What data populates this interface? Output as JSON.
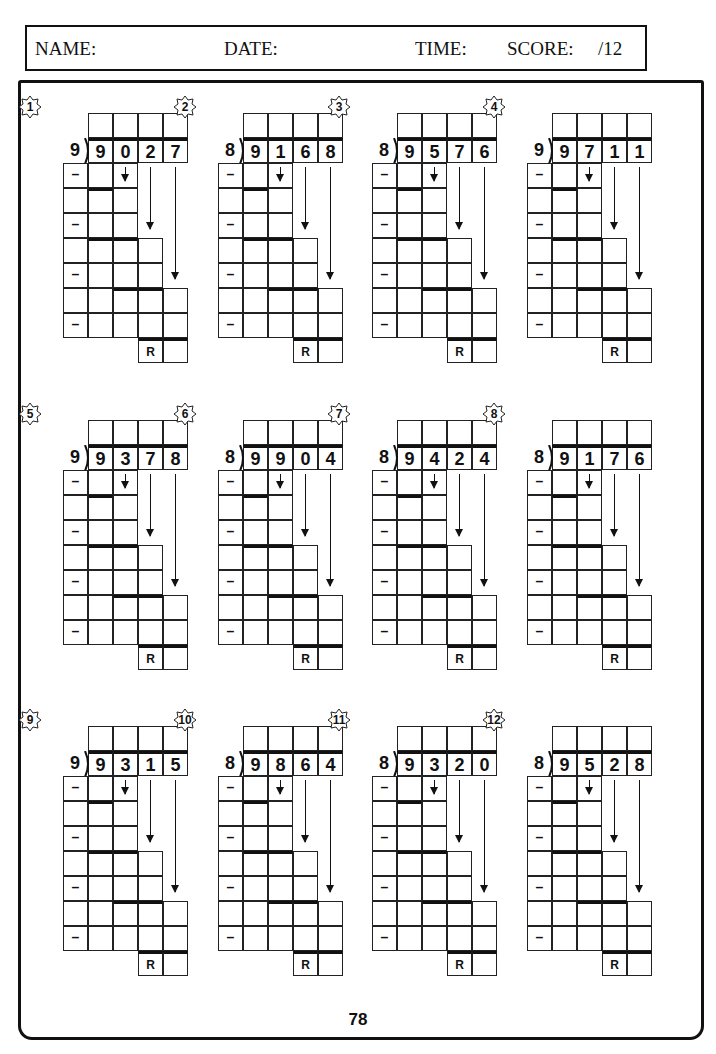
{
  "header": {
    "name_label": "NAME:",
    "date_label": "DATE:",
    "time_label": "TIME:",
    "score_label": "SCORE:",
    "score_total": "/12"
  },
  "work_symbols": {
    "minus": "–",
    "remainder": "R"
  },
  "problems": [
    {
      "number": "1",
      "divisor": "9",
      "dividend": [
        "9",
        "0",
        "2",
        "7"
      ]
    },
    {
      "number": "2",
      "divisor": "8",
      "dividend": [
        "9",
        "1",
        "6",
        "8"
      ]
    },
    {
      "number": "3",
      "divisor": "8",
      "dividend": [
        "9",
        "5",
        "7",
        "6"
      ]
    },
    {
      "number": "4",
      "divisor": "9",
      "dividend": [
        "9",
        "7",
        "1",
        "1"
      ]
    },
    {
      "number": "5",
      "divisor": "9",
      "dividend": [
        "9",
        "3",
        "7",
        "8"
      ]
    },
    {
      "number": "6",
      "divisor": "8",
      "dividend": [
        "9",
        "9",
        "0",
        "4"
      ]
    },
    {
      "number": "7",
      "divisor": "8",
      "dividend": [
        "9",
        "4",
        "2",
        "4"
      ]
    },
    {
      "number": "8",
      "divisor": "8",
      "dividend": [
        "9",
        "1",
        "7",
        "6"
      ]
    },
    {
      "number": "9",
      "divisor": "9",
      "dividend": [
        "9",
        "3",
        "1",
        "5"
      ]
    },
    {
      "number": "10",
      "divisor": "8",
      "dividend": [
        "9",
        "8",
        "6",
        "4"
      ]
    },
    {
      "number": "11",
      "divisor": "8",
      "dividend": [
        "9",
        "3",
        "2",
        "0"
      ]
    },
    {
      "number": "12",
      "divisor": "8",
      "dividend": [
        "9",
        "5",
        "2",
        "8"
      ]
    }
  ],
  "footer": {
    "page_number": "78"
  }
}
